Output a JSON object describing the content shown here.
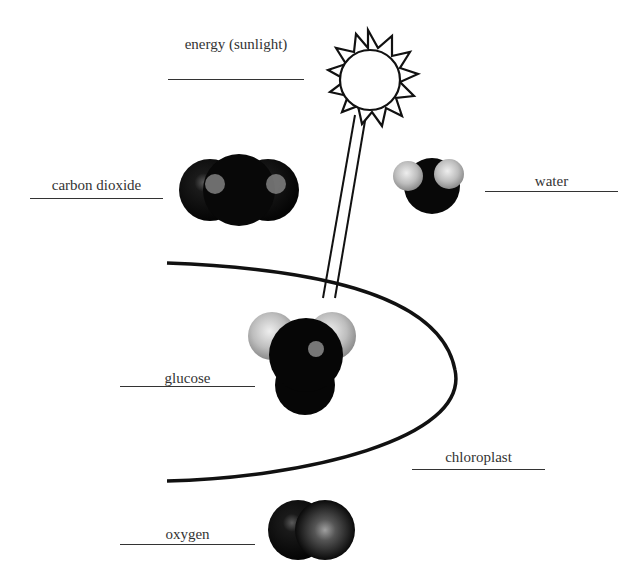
{
  "diagram": {
    "type": "photosynthesis-labeled-diagram",
    "labels": {
      "energy": "energy (sunlight)",
      "carbon_dioxide": "carbon dioxide",
      "water": "water",
      "glucose": "glucose",
      "chloroplast": "chloroplast",
      "oxygen": "oxygen"
    },
    "colors": {
      "atom_dark": "#0a0a0a",
      "atom_light": "#c8c8c8",
      "line": "#111111",
      "text": "#333333"
    }
  }
}
